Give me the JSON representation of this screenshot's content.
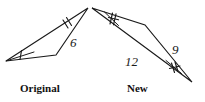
{
  "figure": {
    "type": "geometry-diagram",
    "background_color": "#ffffff",
    "stroke_color": "#1a1a1a",
    "text_color": "#111111"
  },
  "triangles": [
    {
      "id": "original",
      "caption": "Original",
      "vertices": [
        {
          "name": "apex",
          "x": 88,
          "y": 8
        },
        {
          "name": "left",
          "x": 6,
          "y": 61
        },
        {
          "name": "base-right",
          "x": 56,
          "y": 55
        }
      ],
      "labeled_sides": [
        {
          "label": "6",
          "from": "apex",
          "to": "base-right"
        }
      ],
      "tick_marks": [
        {
          "side": "apex-left",
          "count": 2
        },
        {
          "side": "left-vertex-angle",
          "count": 1
        }
      ]
    },
    {
      "id": "new",
      "caption": "New",
      "vertices": [
        {
          "name": "top-left",
          "x": 92,
          "y": 8
        },
        {
          "name": "mid",
          "x": 145,
          "y": 25
        },
        {
          "name": "bottom-right",
          "x": 192,
          "y": 82
        }
      ],
      "labeled_sides": [
        {
          "label": "12",
          "from": "top-left",
          "to": "bottom-right"
        },
        {
          "label": "9",
          "from": "mid",
          "to": "bottom-right"
        }
      ],
      "tick_marks": [
        {
          "side": "top-left-angle",
          "count": 2
        },
        {
          "side": "bottom-right-angle",
          "count": 2
        }
      ]
    }
  ],
  "labels": {
    "six": "6",
    "twelve": "12",
    "nine": "9",
    "original": "Original",
    "new": "New"
  }
}
